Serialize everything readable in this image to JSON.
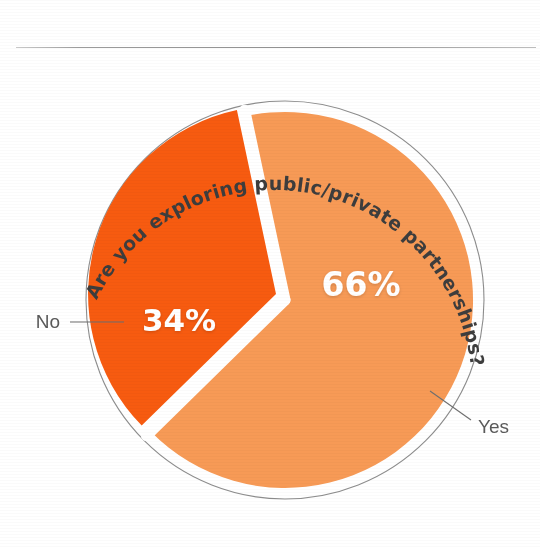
{
  "page": {
    "background_color": "#ffffff",
    "divider_color": "#9c9c9c"
  },
  "chart_data": {
    "type": "pie",
    "title": "Are you exploring public/private partnerships?",
    "categories": [
      "Yes",
      "No"
    ],
    "values": [
      66,
      34
    ],
    "value_labels": [
      "66%",
      "34%"
    ],
    "colors": [
      "#F79A56",
      "#F75B10"
    ],
    "legend": "none",
    "label_placement": "leader-lines",
    "series": [
      {
        "name": "Responses",
        "slices": [
          {
            "label": "Yes",
            "value": 66,
            "value_label": "66%",
            "color": "#F79A56",
            "exploded": false
          },
          {
            "label": "No",
            "value": 34,
            "value_label": "34%",
            "color": "#F75B10",
            "exploded": true
          }
        ]
      }
    ],
    "units": "percent",
    "total": 100,
    "xlabel": "",
    "ylabel": "",
    "grid": false
  },
  "labels": {
    "title": "Are you exploring public/private partnerships?",
    "no_label": "No",
    "yes_label": "Yes",
    "no_percent": "34%",
    "yes_percent": "66%"
  }
}
